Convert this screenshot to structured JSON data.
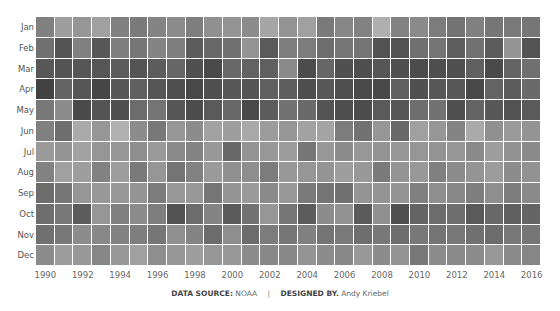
{
  "chart_data": {
    "type": "heatmap",
    "title": "",
    "xlabel": "",
    "ylabel": "",
    "color_scale": "grayscale (darker = higher value)",
    "x": [
      1990,
      1991,
      1992,
      1993,
      1994,
      1995,
      1996,
      1997,
      1998,
      1999,
      2000,
      2001,
      2002,
      2003,
      2004,
      2005,
      2006,
      2007,
      2008,
      2009,
      2010,
      2011,
      2012,
      2013,
      2014,
      2015,
      2016
    ],
    "x_tick_labels": [
      "1990",
      "1992",
      "1994",
      "1996",
      "1998",
      "2000",
      "2002",
      "2004",
      "2006",
      "2008",
      "2010",
      "2012",
      "2014",
      "2016"
    ],
    "y": [
      "Jan",
      "Feb",
      "Mar",
      "Apr",
      "May",
      "Jun",
      "Jul",
      "Aug",
      "Sep",
      "Oct",
      "Nov",
      "Dec"
    ],
    "gray_hex_values": [
      [
        128,
        158,
        150,
        160,
        128,
        122,
        132,
        140,
        126,
        144,
        148,
        140,
        166,
        148,
        160,
        122,
        135,
        130,
        175,
        130,
        138,
        124,
        115,
        128,
        118,
        122,
        118
      ],
      [
        112,
        84,
        128,
        88,
        126,
        118,
        132,
        126,
        92,
        104,
        112,
        148,
        90,
        126,
        124,
        110,
        118,
        116,
        82,
        82,
        112,
        116,
        94,
        114,
        92,
        148,
        84
      ],
      [
        88,
        84,
        86,
        86,
        92,
        84,
        92,
        102,
        80,
        74,
        104,
        98,
        96,
        138,
        76,
        102,
        80,
        78,
        86,
        80,
        76,
        78,
        80,
        96,
        74,
        100,
        112
      ],
      [
        66,
        100,
        86,
        70,
        88,
        96,
        86,
        80,
        72,
        80,
        88,
        84,
        96,
        94,
        78,
        88,
        80,
        74,
        72,
        96,
        80,
        88,
        88,
        72,
        100,
        92,
        106
      ],
      [
        120,
        140,
        74,
        84,
        80,
        108,
        116,
        86,
        76,
        90,
        104,
        74,
        92,
        114,
        106,
        84,
        78,
        76,
        90,
        86,
        110,
        114,
        80,
        100,
        88,
        82,
        90
      ],
      [
        128,
        110,
        170,
        150,
        176,
        140,
        120,
        150,
        140,
        162,
        158,
        168,
        156,
        150,
        162,
        164,
        124,
        114,
        150,
        104,
        160,
        150,
        132,
        170,
        144,
        154,
        148
      ],
      [
        154,
        148,
        162,
        150,
        150,
        142,
        154,
        138,
        132,
        152,
        104,
        148,
        152,
        156,
        118,
        152,
        140,
        152,
        148,
        150,
        150,
        148,
        150,
        138,
        158,
        146,
        138
      ],
      [
        130,
        160,
        158,
        130,
        158,
        122,
        150,
        116,
        130,
        154,
        144,
        142,
        124,
        152,
        150,
        148,
        158,
        152,
        122,
        148,
        152,
        128,
        140,
        148,
        156,
        140,
        146
      ],
      [
        108,
        118,
        150,
        152,
        152,
        148,
        124,
        152,
        152,
        118,
        148,
        154,
        138,
        152,
        122,
        116,
        112,
        148,
        148,
        148,
        128,
        142,
        136,
        126,
        142,
        124,
        138
      ],
      [
        110,
        120,
        92,
        150,
        128,
        140,
        126,
        82,
        108,
        132,
        90,
        114,
        150,
        118,
        92,
        140,
        146,
        90,
        144,
        80,
        100,
        108,
        110,
        90,
        104,
        96,
        100
      ],
      [
        112,
        120,
        140,
        136,
        130,
        126,
        118,
        144,
        132,
        108,
        142,
        108,
        124,
        118,
        128,
        116,
        122,
        110,
        120,
        110,
        120,
        116,
        120,
        112,
        108,
        120,
        118
      ],
      [
        140,
        156,
        152,
        134,
        152,
        160,
        142,
        150,
        158,
        150,
        152,
        140,
        136,
        136,
        148,
        140,
        136,
        152,
        140,
        148,
        120,
        140,
        138,
        140,
        152,
        138,
        134
      ]
    ],
    "legend": null,
    "grid": false,
    "footer": "DATA SOURCE: NOAA | DESIGNED BY. Andy Kriebel"
  },
  "footer": {
    "source_label": "DATA SOURCE:",
    "source_value": "NOAA",
    "separator": "|",
    "designer_label": "DESIGNED BY.",
    "designer_value": "Andy Kriebel"
  }
}
